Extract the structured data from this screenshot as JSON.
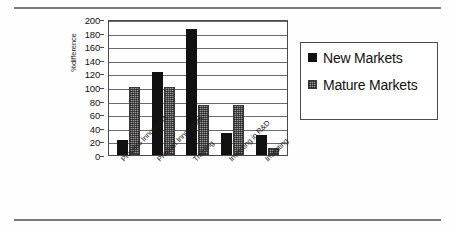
{
  "chart_data": {
    "type": "bar",
    "title": "",
    "xlabel": "",
    "ylabel": "%difference",
    "ylim": [
      0,
      200
    ],
    "yticks": [
      0,
      20,
      40,
      60,
      80,
      100,
      120,
      140,
      160,
      180,
      200
    ],
    "grid": true,
    "legend_position": "right",
    "categories": [
      "Process Innovators",
      "Product Innovators",
      "Training",
      "Investing in R&D",
      "Investing"
    ],
    "series": [
      {
        "name": "New Markets",
        "color": "#111111",
        "values": [
          22,
          122,
          186,
          33,
          29
        ]
      },
      {
        "name": "Mature Markets",
        "color": "#9a9a9a",
        "values": [
          100,
          100,
          74,
          73,
          11
        ]
      }
    ]
  },
  "legend": {
    "entries": [
      {
        "label": "New Markets"
      },
      {
        "label": "Mature Markets"
      }
    ]
  }
}
